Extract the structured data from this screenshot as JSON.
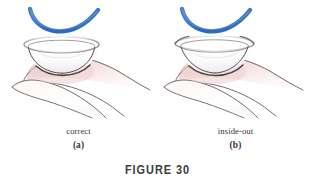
{
  "figure": {
    "caption": "FIGURE 30",
    "panels": [
      {
        "id": "a",
        "name": "correct",
        "tag": "(a)",
        "lens_state": "correct",
        "description": "Contact lens resting on a fingertip with a smooth bowl shape and rim curving inward; a blue arc above indicates the correct profile."
      },
      {
        "id": "b",
        "name": "inside-out",
        "tag": "(b)",
        "lens_state": "inside-out",
        "description": "Contact lens resting on a fingertip with the rim flared outward; a blue arc above indicates the reference profile."
      }
    ]
  },
  "colors": {
    "arc_blue": "#2f6cc0",
    "arc_blue_light": "#6b9ddb",
    "ink": "#4a4446",
    "ink_dark": "#2b2628",
    "skin_pink": "#f5dfe0",
    "skin_pink_deep": "#edc9cb",
    "lens_gray": "#cfcccb",
    "lens_highlight": "#ffffff",
    "text": "#3a3537",
    "background": "#ffffff"
  },
  "icons": {
    "arc": "blue-arc-icon",
    "lens": "contact-lens-icon",
    "finger": "fingertip-icon"
  }
}
